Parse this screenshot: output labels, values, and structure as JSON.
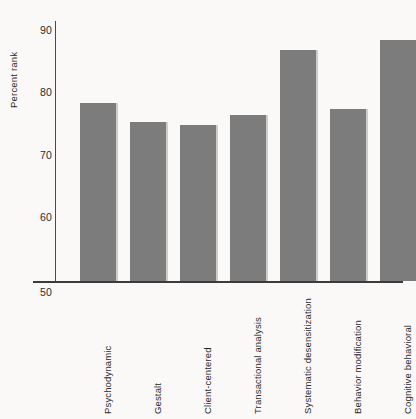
{
  "chart_data": {
    "type": "bar",
    "title": "",
    "subtitle": "",
    "xlabel": "",
    "ylabel": "Percent rank",
    "categories": [
      "Psychodynamic",
      "Gestalt",
      "Client-centered",
      "Transactional analysis",
      "Systematic desensitization",
      "Behavior modification",
      "Cognitive behavioral"
    ],
    "values": [
      78.5,
      75.5,
      75.0,
      76.5,
      87.0,
      77.5,
      88.5
    ],
    "ylim": [
      50,
      90
    ],
    "yticks": [
      50,
      60,
      70,
      80,
      90
    ],
    "ytick_labels": [
      "50",
      "60",
      "70",
      "80",
      "90"
    ],
    "grid": false,
    "legend": false,
    "legend_position": "none",
    "bar_color": "#7c7c7c",
    "background_color": "#faf9f7",
    "axis_color": "#3c3c3c",
    "text_color": "#2b2b2b"
  }
}
